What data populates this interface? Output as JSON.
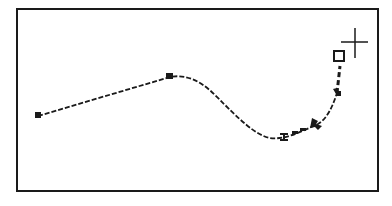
{
  "canvas": {
    "background": "#ffffff",
    "stroke_color": "#1a1a1a"
  },
  "path": {
    "description": "Bezier curve being drawn with pen tool",
    "anchor_points": [
      {
        "name": "start",
        "x": 38,
        "y": 116
      },
      {
        "name": "peak",
        "x": 170,
        "y": 76
      },
      {
        "name": "trough",
        "x": 284,
        "y": 137
      },
      {
        "name": "rise-1",
        "x": 318,
        "y": 124
      },
      {
        "name": "rise-2",
        "x": 337,
        "y": 93
      }
    ],
    "handle": {
      "x": 340,
      "y": 58
    },
    "cursor": {
      "type": "crosshair",
      "x": 353,
      "y": 42
    }
  },
  "icons": {
    "cursor": "crosshair-icon",
    "handle": "square-handle-icon",
    "anchor": "anchor-point-icon"
  }
}
